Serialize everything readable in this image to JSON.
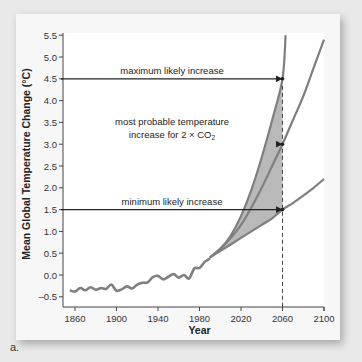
{
  "chart_data": {
    "type": "line",
    "title": "",
    "xlabel": "Year",
    "ylabel": "Mean Global Temperature Change (°C)",
    "xlim": [
      1850,
      2100
    ],
    "ylim": [
      -0.7,
      5.5
    ],
    "x_ticks": [
      "1860",
      "1900",
      "1940",
      "1980",
      "2020",
      "2060",
      "2100"
    ],
    "y_ticks": [
      "5.5",
      "5.0",
      "4.5",
      "4.0",
      "3.5",
      "3.0",
      "2.5",
      "2.0",
      "1.5",
      "1.0",
      "0.5",
      "0.0",
      "–0.5"
    ],
    "grid": false,
    "series": [
      {
        "name": "observed",
        "x": [
          1855,
          1860,
          1865,
          1870,
          1875,
          1880,
          1885,
          1890,
          1895,
          1900,
          1905,
          1910,
          1915,
          1920,
          1925,
          1930,
          1935,
          1940,
          1945,
          1950,
          1955,
          1960,
          1965,
          1970,
          1975,
          1980,
          1985,
          1990
        ],
        "values": [
          -0.35,
          -0.38,
          -0.3,
          -0.35,
          -0.28,
          -0.34,
          -0.3,
          -0.32,
          -0.22,
          -0.36,
          -0.33,
          -0.26,
          -0.31,
          -0.22,
          -0.18,
          -0.17,
          -0.05,
          -0.02,
          -0.1,
          -0.04,
          0.02,
          -0.06,
          0.0,
          -0.08,
          0.15,
          0.16,
          0.3,
          0.38
        ]
      },
      {
        "name": "maximum projection",
        "x": [
          1990,
          2000,
          2010,
          2020,
          2030,
          2040,
          2050,
          2060,
          2063
        ],
        "values": [
          0.4,
          0.6,
          0.9,
          1.35,
          1.95,
          2.7,
          3.55,
          4.5,
          5.5
        ]
      },
      {
        "name": "most probable projection",
        "x": [
          1990,
          2000,
          2010,
          2020,
          2030,
          2040,
          2050,
          2060,
          2070,
          2080,
          2090,
          2100
        ],
        "values": [
          0.4,
          0.6,
          0.85,
          1.15,
          1.55,
          2.0,
          2.5,
          3.0,
          3.55,
          4.1,
          4.75,
          5.4
        ]
      },
      {
        "name": "minimum projection",
        "x": [
          1990,
          2000,
          2010,
          2020,
          2030,
          2040,
          2050,
          2060,
          2070,
          2080,
          2090,
          2100
        ],
        "values": [
          0.4,
          0.55,
          0.7,
          0.85,
          1.0,
          1.15,
          1.3,
          1.5,
          1.65,
          1.82,
          2.0,
          2.2
        ]
      }
    ],
    "reference_lines": [
      {
        "label": "maximum likely increase",
        "y": 4.5,
        "to_year": 2060
      },
      {
        "label_line1": "most probable temperature",
        "label_line2": "increase for 2 × CO",
        "label_sub": "2",
        "y": 3.0,
        "to_year": 2060
      },
      {
        "label": "minimum likely increase",
        "y": 1.5,
        "to_year": 2060
      }
    ],
    "vertical_marker": {
      "year": 2060,
      "style": "dashed"
    },
    "shaded_region": "between maximum and minimum projections, 1990–2060",
    "colors": {
      "curve": "#7f7f7f",
      "shade": "#b9b9b9",
      "arrow": "#222222"
    }
  },
  "caption": "a."
}
